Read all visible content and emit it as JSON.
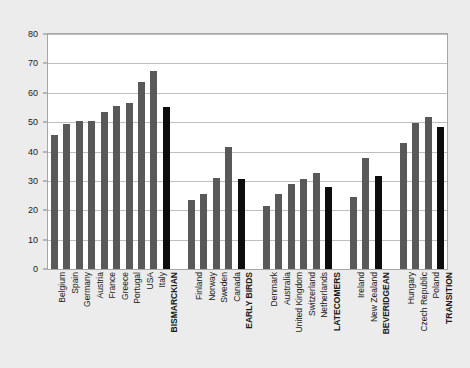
{
  "chart_data": {
    "type": "bar",
    "title": "",
    "subtitle": "",
    "xlabel": "",
    "ylabel": "",
    "ylim": [
      0,
      80
    ],
    "ytick_step": 10,
    "yticks": [
      0,
      10,
      20,
      30,
      40,
      50,
      60,
      70,
      80
    ],
    "grid": true,
    "legend": "none",
    "orientation": "vertical",
    "series_colors": {
      "country_bar": "#595959",
      "group_summary_bar": "#0d0d0d"
    },
    "groups": [
      {
        "name": "BISMARCKIAN",
        "categories": [
          "Belgium",
          "Spain",
          "Germany",
          "Austria",
          "France",
          "Greece",
          "Portugal",
          "USA",
          "Italy"
        ],
        "values": [
          45.5,
          49.5,
          50.5,
          50.5,
          53.5,
          55.5,
          56.5,
          63.5,
          67.5
        ],
        "summary_label": "BISMARCKIAN",
        "summary_value": 55.0
      },
      {
        "name": "EARLY BIRDS",
        "categories": [
          "Finland",
          "Norway",
          "Sweden",
          "Canada"
        ],
        "values": [
          23.5,
          25.5,
          31.0,
          41.5
        ],
        "summary_label": "EARLY BIRDS",
        "summary_value": 30.5
      },
      {
        "name": "LATECOMERS",
        "categories": [
          "Denmark",
          "Australia",
          "United Kingdom",
          "Switzerland",
          "Netherlands"
        ],
        "values": [
          21.5,
          25.5,
          28.8,
          30.5,
          32.8
        ],
        "summary_label": "LATECOMERS",
        "summary_value": 28.0
      },
      {
        "name": "BEVERIDGEAN",
        "categories": [
          "Ireland",
          "New Zealand"
        ],
        "values": [
          24.5,
          37.8
        ],
        "summary_label": "BEVERIDGEAN",
        "summary_value": 31.5
      },
      {
        "name": "TRANSITION",
        "categories": [
          "Hungary",
          "Czech Republic",
          "Poland"
        ],
        "values": [
          42.8,
          49.8,
          51.8
        ],
        "summary_label": "TRANSITION",
        "summary_value": 48.2
      }
    ],
    "categories": [
      "Belgium",
      "Spain",
      "Germany",
      "Austria",
      "France",
      "Greece",
      "Portugal",
      "USA",
      "Italy",
      "BISMARCKIAN",
      "Finland",
      "Norway",
      "Sweden",
      "Canada",
      "EARLY BIRDS",
      "Denmark",
      "Australia",
      "United Kingdom",
      "Switzerland",
      "Netherlands",
      "LATECOMERS",
      "Ireland",
      "New Zealand",
      "BEVERIDGEAN",
      "Hungary",
      "Czech Republic",
      "Poland",
      "TRANSITION"
    ],
    "values": [
      45.5,
      49.5,
      50.5,
      50.5,
      53.5,
      55.5,
      56.5,
      63.5,
      67.5,
      55.0,
      23.5,
      25.5,
      31.0,
      41.5,
      30.5,
      21.5,
      25.5,
      28.8,
      30.5,
      32.8,
      28.0,
      24.5,
      37.8,
      31.5,
      42.8,
      49.8,
      51.8,
      48.2
    ],
    "bar_kinds": [
      "normal",
      "normal",
      "normal",
      "normal",
      "normal",
      "normal",
      "normal",
      "normal",
      "normal",
      "summary",
      "normal",
      "normal",
      "normal",
      "normal",
      "summary",
      "normal",
      "normal",
      "normal",
      "normal",
      "normal",
      "summary",
      "normal",
      "normal",
      "summary",
      "normal",
      "normal",
      "normal",
      "summary"
    ]
  },
  "colors": {
    "page_background": "#ececec",
    "plot_background": "#ffffff",
    "plot_border": "#a6a6a6",
    "gridline": "#bfbfbf",
    "axis_text": "#1a1a1a"
  }
}
